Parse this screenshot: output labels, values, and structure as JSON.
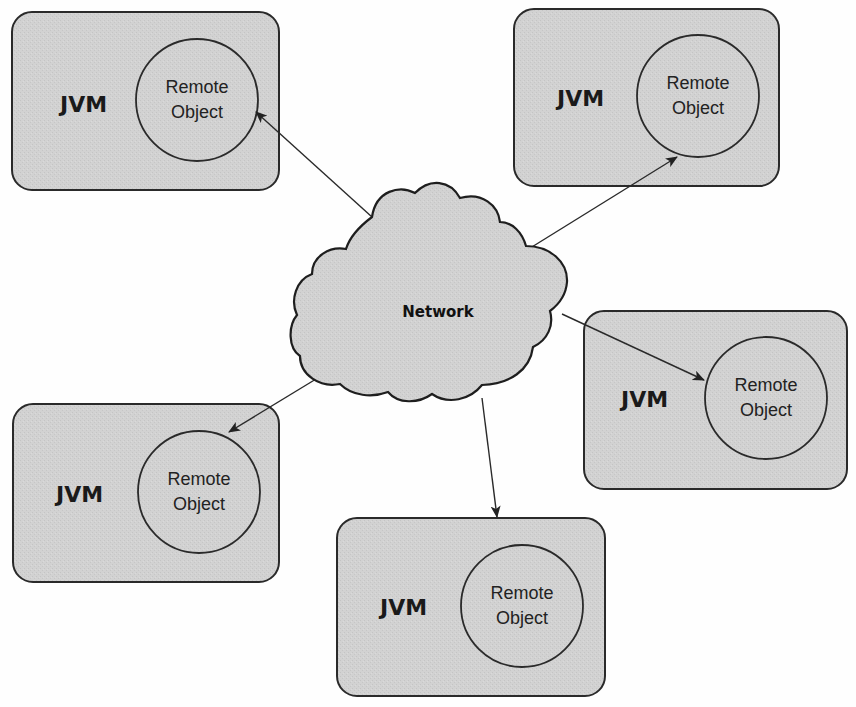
{
  "diagram": {
    "type": "network-topology",
    "colors": {
      "box_fill": "#d0d0d0",
      "stroke": "#2a2a2a",
      "background": "#fefefe",
      "cloud_fill": "#cfcfcf"
    },
    "network": {
      "label": "Network"
    },
    "nodes": [
      {
        "id": "jvm-top-left",
        "label": "JVM",
        "object_line1": "Remote",
        "object_line2": "Object"
      },
      {
        "id": "jvm-top-right",
        "label": "JVM",
        "object_line1": "Remote",
        "object_line2": "Object"
      },
      {
        "id": "jvm-middle-right",
        "label": "JVM",
        "object_line1": "Remote",
        "object_line2": "Object"
      },
      {
        "id": "jvm-bottom-left",
        "label": "JVM",
        "object_line1": "Remote",
        "object_line2": "Object"
      },
      {
        "id": "jvm-bottom-center",
        "label": "JVM",
        "object_line1": "Remote",
        "object_line2": "Object"
      }
    ],
    "edges": [
      {
        "from": "network",
        "to": "jvm-top-left"
      },
      {
        "from": "network",
        "to": "jvm-top-right"
      },
      {
        "from": "network",
        "to": "jvm-middle-right"
      },
      {
        "from": "network",
        "to": "jvm-bottom-left"
      },
      {
        "from": "network",
        "to": "jvm-bottom-center"
      }
    ]
  }
}
